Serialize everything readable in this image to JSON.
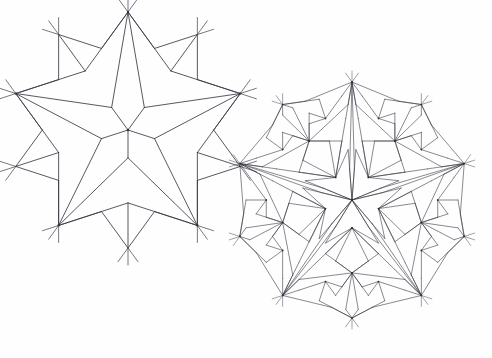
{
  "page": {
    "background_color": "#fefefe",
    "width": 492,
    "height": 358,
    "ink_color": "#3a3a44",
    "vertex_dot_color": "#23232b"
  },
  "figures": [
    {
      "id": "left-tiling",
      "name": "coarse-penrose-rhombic-tiling",
      "caption": "",
      "center_x": 128,
      "center_y": 130,
      "radius": 118,
      "deflation_generations": 2,
      "seed": "sun",
      "stroke_width": 0.85,
      "vertex_dot_radius": 1.15,
      "spoke_length": 17,
      "show_vertex_dots": true,
      "show_boundary_spokes": true
    },
    {
      "id": "right-tiling",
      "name": "fine-penrose-rhombic-tiling",
      "caption": "",
      "center_x": 352,
      "center_y": 200,
      "radius": 118,
      "deflation_generations": 4,
      "seed": "sun",
      "stroke_width": 0.6,
      "vertex_dot_radius": 0.85,
      "spoke_length": 11,
      "show_vertex_dots": true,
      "show_boundary_spokes": true
    }
  ],
  "chart_data": {
    "type": "diagram",
    "prototiles": [
      {
        "name": "fat rhombus",
        "acute_angle_deg": 72,
        "obtuse_angle_deg": 108
      },
      {
        "name": "thin rhombus",
        "acute_angle_deg": 36,
        "obtuse_angle_deg": 144
      }
    ],
    "symmetry": "10-fold (D10) about the patch center",
    "inflation_ratio": 1.618033988749895,
    "rotational_step_deg": 36,
    "panels": [
      {
        "label": "left",
        "generations": 2,
        "tile_edge_px": 45,
        "approx_tile_count": 55
      },
      {
        "label": "right",
        "generations": 4,
        "tile_edge_px": 17,
        "approx_tile_count": 380
      }
    ],
    "legend": [],
    "annotations": [],
    "grid": false,
    "xlabel": "",
    "ylabel": ""
  }
}
